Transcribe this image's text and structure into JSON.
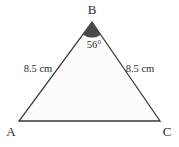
{
  "figure": {
    "type": "isosceles-triangle-diagram",
    "background_color": "#ffffff",
    "stroke_color": "#3a3a3a",
    "interior_fill": "#fcfcfc",
    "angle_marker_fill": "#4a4a4a",
    "vertices": {
      "apex": {
        "label": "B",
        "x": 92,
        "y": 22
      },
      "bottom_left": {
        "label": "A",
        "x": 19,
        "y": 121
      },
      "bottom_right": {
        "label": "C",
        "x": 160,
        "y": 121
      }
    },
    "vertex_labels": {
      "apex": "B",
      "bottom_left": "A",
      "bottom_right": "C"
    },
    "side_labels": {
      "left": "8.5 cm",
      "right": "8.5 cm"
    },
    "angle_labels": {
      "apex": "56°"
    }
  }
}
